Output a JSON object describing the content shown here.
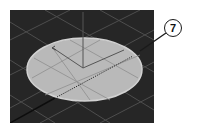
{
  "viewport": {
    "label": "3D viewport",
    "background_color": "#262626",
    "grid_color": "#4e4e4e",
    "object": {
      "type": "ellipse-disc",
      "fill_color": "#b9b9b9",
      "edge_color": "#d2d2d2"
    },
    "gizmo": {
      "icon": "transform-gizmo-icon",
      "color": "#555555"
    }
  },
  "callout": {
    "number": "7",
    "icon": "callout-circle-icon"
  }
}
